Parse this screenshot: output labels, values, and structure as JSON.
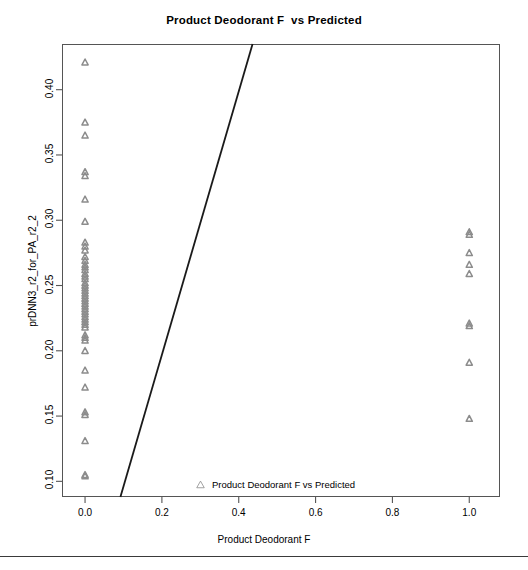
{
  "chart_data": {
    "type": "scatter",
    "title": "Product Deodorant F  vs Predicted",
    "xlabel": "Product Deodorant F",
    "ylabel": "prDNN3_r2_for_PA_r2_2",
    "xlim": [
      -0.06,
      1.08
    ],
    "ylim": [
      0.088,
      0.435
    ],
    "xticks": [
      "0.0",
      "0.2",
      "0.4",
      "0.6",
      "0.8",
      "1.0"
    ],
    "xtick_values": [
      0.0,
      0.2,
      0.4,
      0.6,
      0.8,
      1.0
    ],
    "yticks": [
      "0.10",
      "0.15",
      "0.20",
      "0.25",
      "0.30",
      "0.35",
      "0.40"
    ],
    "ytick_values": [
      0.1,
      0.15,
      0.2,
      0.25,
      0.3,
      0.35,
      0.4
    ],
    "grid": false,
    "marker": "triangle-up",
    "marker_color": "#8c8c8c",
    "legend": [
      {
        "label": "Product Deodorant F vs Predicted",
        "marker": "triangle-up",
        "color": "#8c8c8c"
      }
    ],
    "legend_position": "bottom-center-inside",
    "series": [
      {
        "name": "Product Deodorant F vs Predicted",
        "x": [
          0.0,
          0.0,
          0.0,
          0.0,
          0.0,
          0.0,
          0.0,
          0.0,
          0.0,
          0.0,
          0.0,
          0.0,
          0.0,
          0.0,
          0.0,
          0.0,
          0.0,
          0.0,
          0.0,
          0.0,
          0.0,
          0.0,
          0.0,
          0.0,
          0.0,
          0.0,
          0.0,
          0.0,
          0.0,
          0.0,
          0.0,
          0.0,
          0.0,
          0.0,
          0.0,
          0.0,
          0.0,
          0.0,
          0.0,
          0.0,
          0.0,
          0.0,
          0.0,
          0.0,
          0.0,
          0.0,
          0.0,
          1.0,
          1.0,
          1.0,
          1.0,
          1.0,
          1.0,
          1.0,
          1.0,
          1.0
        ],
        "y": [
          0.421,
          0.375,
          0.365,
          0.337,
          0.334,
          0.316,
          0.299,
          0.283,
          0.28,
          0.277,
          0.272,
          0.269,
          0.266,
          0.264,
          0.262,
          0.259,
          0.257,
          0.255,
          0.252,
          0.25,
          0.248,
          0.246,
          0.244,
          0.242,
          0.24,
          0.238,
          0.236,
          0.234,
          0.232,
          0.23,
          0.228,
          0.226,
          0.224,
          0.222,
          0.22,
          0.218,
          0.212,
          0.21,
          0.208,
          0.2,
          0.185,
          0.172,
          0.153,
          0.151,
          0.131,
          0.105,
          0.104,
          0.291,
          0.289,
          0.275,
          0.266,
          0.259,
          0.221,
          0.219,
          0.191,
          0.148
        ]
      }
    ],
    "fit_line": {
      "type": "line",
      "color": "#1a1a1a",
      "width": 1.8,
      "x_start": 0.092,
      "y_start": 0.088,
      "x_end": 0.436,
      "y_end": 0.435
    }
  }
}
